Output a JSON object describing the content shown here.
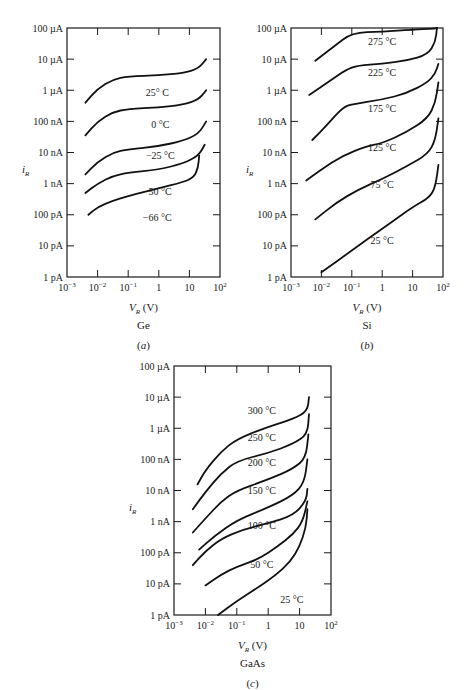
{
  "figure": {
    "panels": [
      {
        "id": "a",
        "material": "Ge",
        "caption": "(a)"
      },
      {
        "id": "b",
        "material": "Si",
        "caption": "(b)"
      },
      {
        "id": "c",
        "material": "GaAs",
        "caption": "(c)"
      }
    ]
  },
  "chart_data": [
    {
      "type": "line",
      "title": "Ge",
      "caption": "(a)",
      "xlabel": "V_R (V)",
      "ylabel": "i_R",
      "xscale": "log",
      "yscale": "log",
      "xlim": [
        0.001,
        100
      ],
      "ylim": [
        1e-12,
        0.0001
      ],
      "x_tick_labels": [
        "10^-3",
        "10^-2",
        "10^-1",
        "1",
        "10",
        "10^2"
      ],
      "y_tick_labels": [
        "1 pA",
        "10 pA",
        "100 pA",
        "1 nA",
        "10 nA",
        "100 nA",
        "1 µA",
        "10 µA",
        "100 µA"
      ],
      "grid": false,
      "series": [
        {
          "name": "25° C",
          "label_pos": [
            -0.05,
            -6.2
          ],
          "points": [
            [
              -2.4,
              -6.4
            ],
            [
              -2.0,
              -5.95
            ],
            [
              -1.5,
              -5.65
            ],
            [
              -1.0,
              -5.55
            ],
            [
              0,
              -5.52
            ],
            [
              0.8,
              -5.45
            ],
            [
              1.3,
              -5.3
            ],
            [
              1.55,
              -5.0
            ]
          ]
        },
        {
          "name": "0 °C",
          "label_pos": [
            0.05,
            -7.2
          ],
          "points": [
            [
              -2.4,
              -7.45
            ],
            [
              -2.0,
              -7.0
            ],
            [
              -1.5,
              -6.7
            ],
            [
              -1.0,
              -6.6
            ],
            [
              0,
              -6.55
            ],
            [
              0.8,
              -6.47
            ],
            [
              1.3,
              -6.3
            ],
            [
              1.55,
              -6.0
            ]
          ]
        },
        {
          "name": "-25 °C",
          "label_pos": [
            0.05,
            -8.2
          ],
          "points": [
            [
              -2.4,
              -8.7
            ],
            [
              -2.0,
              -8.3
            ],
            [
              -1.5,
              -8.0
            ],
            [
              -1.0,
              -7.9
            ],
            [
              0,
              -7.8
            ],
            [
              0.8,
              -7.62
            ],
            [
              1.3,
              -7.4
            ],
            [
              1.55,
              -7.0
            ]
          ]
        },
        {
          "name": "-50 °C",
          "label_pos": [
            -0.05,
            -9.35
          ],
          "points": [
            [
              -2.4,
              -9.3
            ],
            [
              -2.0,
              -9.0
            ],
            [
              -1.5,
              -8.75
            ],
            [
              -1.0,
              -8.65
            ],
            [
              0,
              -8.55
            ],
            [
              0.8,
              -8.35
            ],
            [
              1.3,
              -8.1
            ],
            [
              1.5,
              -7.75
            ]
          ]
        },
        {
          "name": "-66 °C",
          "label_pos": [
            -0.05,
            -10.2
          ],
          "points": [
            [
              -2.3,
              -10.0
            ],
            [
              -2.0,
              -9.75
            ],
            [
              -1.5,
              -9.55
            ],
            [
              -1.0,
              -9.4
            ],
            [
              0,
              -9.15
            ],
            [
              0.8,
              -8.95
            ],
            [
              1.15,
              -8.8
            ],
            [
              1.28,
              -8.5
            ],
            [
              1.32,
              -8.1
            ]
          ]
        }
      ]
    },
    {
      "type": "line",
      "title": "Si",
      "caption": "(b)",
      "xlabel": "V_R (V)",
      "ylabel": "i_R",
      "xscale": "log",
      "yscale": "log",
      "xlim": [
        0.001,
        100
      ],
      "ylim": [
        1e-12,
        0.0001
      ],
      "x_tick_labels": [
        "10^-3",
        "10^-2",
        "10^-1",
        "1",
        "10",
        "10^2"
      ],
      "y_tick_labels": [
        "1 pA",
        "10 pA",
        "100 pA",
        "1 nA",
        "10 nA",
        "100 nA",
        "1 µA",
        "10 µA",
        "100 µA"
      ],
      "grid": false,
      "series": [
        {
          "name": "275 °C",
          "label_pos": [
            0.0,
            -4.55
          ],
          "points": [
            [
              -2.2,
              -5.05
            ],
            [
              -1.6,
              -4.6
            ],
            [
              -1.0,
              -4.15
            ],
            [
              0,
              -4.12
            ],
            [
              1.0,
              -4.05
            ],
            [
              1.7,
              -4.02
            ],
            [
              1.8,
              -4.0
            ]
          ]
        },
        {
          "name": "225 °C",
          "label_pos": [
            0.0,
            -5.55
          ],
          "points": [
            [
              -2.4,
              -6.15
            ],
            [
              -1.8,
              -5.75
            ],
            [
              -1.2,
              -5.35
            ],
            [
              -0.8,
              -5.2
            ],
            [
              0,
              -5.15
            ],
            [
              0.8,
              -5.05
            ],
            [
              1.5,
              -4.85
            ],
            [
              1.75,
              -4.45
            ],
            [
              1.8,
              -4.0
            ]
          ]
        },
        {
          "name": "175 °C",
          "label_pos": [
            0.0,
            -6.7
          ],
          "points": [
            [
              -2.3,
              -7.6
            ],
            [
              -1.8,
              -7.1
            ],
            [
              -1.3,
              -6.55
            ],
            [
              -1.0,
              -6.45
            ],
            [
              0,
              -6.3
            ],
            [
              0.8,
              -6.1
            ],
            [
              1.5,
              -5.75
            ],
            [
              1.75,
              -5.45
            ],
            [
              1.85,
              -5.15
            ]
          ]
        },
        {
          "name": "125 °C",
          "label_pos": [
            0.0,
            -7.95
          ],
          "points": [
            [
              -2.5,
              -8.9
            ],
            [
              -2.0,
              -8.55
            ],
            [
              -1.3,
              -8.1
            ],
            [
              -0.5,
              -7.8
            ],
            [
              0,
              -7.7
            ],
            [
              0.8,
              -7.35
            ],
            [
              1.5,
              -6.9
            ],
            [
              1.75,
              -6.4
            ],
            [
              1.85,
              -5.75
            ]
          ]
        },
        {
          "name": "75 °C",
          "label_pos": [
            0.0,
            -9.15
          ],
          "points": [
            [
              -2.2,
              -10.15
            ],
            [
              -1.5,
              -9.6
            ],
            [
              -0.8,
              -9.2
            ],
            [
              0,
              -8.85
            ],
            [
              0.8,
              -8.45
            ],
            [
              1.5,
              -8.05
            ],
            [
              1.75,
              -7.6
            ],
            [
              1.85,
              -6.9
            ]
          ]
        },
        {
          "name": "25 °C",
          "label_pos": [
            0.0,
            -10.95
          ],
          "points": [
            [
              -2.0,
              -11.85
            ],
            [
              -1.0,
              -11.15
            ],
            [
              0,
              -10.45
            ],
            [
              1.0,
              -9.75
            ],
            [
              1.55,
              -9.45
            ],
            [
              1.75,
              -9.1
            ],
            [
              1.85,
              -8.4
            ]
          ]
        }
      ]
    },
    {
      "type": "line",
      "title": "GaAs",
      "caption": "(c)",
      "xlabel": "V_R (V)",
      "ylabel": "i_R",
      "xscale": "log",
      "yscale": "log",
      "xlim": [
        0.001,
        100
      ],
      "ylim": [
        1e-12,
        0.0001
      ],
      "x_tick_labels": [
        "10^-3",
        "10^-2",
        "10^-1",
        "1",
        "10",
        "10^2"
      ],
      "y_tick_labels": [
        "1 pA",
        "10 pA",
        "100 pA",
        "1 nA",
        "10 nA",
        "100 nA",
        "1 µA",
        "10 µA",
        "100 µA"
      ],
      "grid": false,
      "series": [
        {
          "name": "300 °C",
          "label_pos": [
            -0.2,
            -5.55
          ],
          "points": [
            [
              -2.25,
              -7.8
            ],
            [
              -2.0,
              -7.35
            ],
            [
              -1.5,
              -6.75
            ],
            [
              -1.0,
              -6.35
            ],
            [
              0,
              -5.95
            ],
            [
              0.8,
              -5.7
            ],
            [
              1.25,
              -5.45
            ],
            [
              1.3,
              -5.0
            ]
          ]
        },
        {
          "name": "250 °C",
          "label_pos": [
            -0.2,
            -6.4
          ],
          "points": [
            [
              -2.4,
              -8.6
            ],
            [
              -2.0,
              -8.05
            ],
            [
              -1.5,
              -7.45
            ],
            [
              -1.0,
              -7.05
            ],
            [
              0,
              -6.8
            ],
            [
              0.8,
              -6.5
            ],
            [
              1.25,
              -6.2
            ],
            [
              1.3,
              -5.55
            ]
          ]
        },
        {
          "name": "200 °C",
          "label_pos": [
            -0.2,
            -7.2
          ],
          "points": [
            [
              -2.4,
              -9.35
            ],
            [
              -2.0,
              -8.9
            ],
            [
              -1.5,
              -8.35
            ],
            [
              -1.0,
              -8.0
            ],
            [
              0,
              -7.65
            ],
            [
              0.8,
              -7.3
            ],
            [
              1.2,
              -6.95
            ],
            [
              1.28,
              -6.2
            ]
          ]
        },
        {
          "name": "150 °C",
          "label_pos": [
            -0.2,
            -8.1
          ],
          "points": [
            [
              -2.2,
              -9.9
            ],
            [
              -1.7,
              -9.45
            ],
            [
              -1.0,
              -8.95
            ],
            [
              0,
              -8.55
            ],
            [
              0.8,
              -8.15
            ],
            [
              1.15,
              -7.75
            ],
            [
              1.25,
              -7.0
            ]
          ]
        },
        {
          "name": "100 °C",
          "label_pos": [
            -0.2,
            -9.25
          ],
          "points": [
            [
              -2.4,
              -10.4
            ],
            [
              -2.0,
              -9.95
            ],
            [
              -1.5,
              -9.55
            ],
            [
              -0.8,
              -9.25
            ],
            [
              0,
              -9.05
            ],
            [
              0.8,
              -8.8
            ],
            [
              1.2,
              -8.35
            ],
            [
              1.25,
              -7.95
            ]
          ]
        },
        {
          "name": "50 °C",
          "label_pos": [
            -0.2,
            -10.5
          ],
          "points": [
            [
              -2.0,
              -11.05
            ],
            [
              -1.5,
              -10.7
            ],
            [
              -1.0,
              -10.45
            ],
            [
              -0.3,
              -10.2
            ],
            [
              0.3,
              -9.8
            ],
            [
              0.8,
              -9.4
            ],
            [
              1.1,
              -9.0
            ],
            [
              1.25,
              -8.35
            ]
          ]
        },
        {
          "name": "25 °C",
          "label_pos": [
            0.75,
            -11.6
          ],
          "points": [
            [
              -1.6,
              -12.0
            ],
            [
              -1.0,
              -11.55
            ],
            [
              -0.3,
              -11.1
            ],
            [
              0.2,
              -10.75
            ],
            [
              0.7,
              -10.3
            ],
            [
              1.0,
              -9.8
            ],
            [
              1.2,
              -9.2
            ],
            [
              1.25,
              -8.6
            ]
          ]
        }
      ]
    }
  ]
}
